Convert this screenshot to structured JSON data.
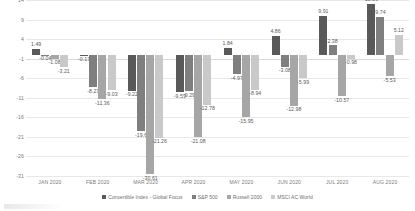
{
  "chart_data": {
    "type": "bar",
    "title": "",
    "subtitle": "",
    "xlabel": "",
    "ylabel": "",
    "ylim": [
      -31,
      14
    ],
    "yticks": [
      14,
      9,
      4,
      -1,
      -6,
      -11,
      -16,
      -21,
      -26,
      -31
    ],
    "grid": true,
    "legend_position": "bottom",
    "categories": [
      "JAN 2020",
      "FEB 2020",
      "MAR 2020",
      "APR 2020",
      "MAY 2020",
      "JUN 2020",
      "JUL 2020",
      "AUG 2020"
    ],
    "series": [
      {
        "name": "Convertible Index - Global Focus",
        "color": "#595959",
        "values": [
          1.49,
          -0.17,
          -9.22,
          -9.53,
          1.84,
          4.86,
          9.91,
          13.06
        ],
        "labels": [
          "1.49",
          "-0.17",
          "-9.22",
          "-9.53",
          "1.84",
          "4.86",
          "9.91",
          "13.06"
        ]
      },
      {
        "name": "S&P 500",
        "color": "#7f7f7f",
        "values": [
          -0.04,
          -8.27,
          -19.6,
          -9.29,
          -4.97,
          -3.08,
          2.38,
          9.74
        ],
        "labels": [
          "-0.04",
          "-8.27",
          "-19.6",
          "-9.29",
          "-4.97",
          "-3.08",
          "2.38",
          "9.74"
        ]
      },
      {
        "name": "Russell 2000",
        "color": "#a6a6a6",
        "values": [
          -1.08,
          -11.36,
          -30.61,
          -21.08,
          -15.95,
          -12.98,
          -10.57,
          -5.53
        ],
        "labels": [
          "-1.08",
          "-11.36",
          "-30.61",
          "-21.08",
          "-15.95",
          "-12.98",
          "-10.57",
          "-5.53"
        ]
      },
      {
        "name": "MSCI AC World",
        "color": "#c9c9c9",
        "values": [
          -3.21,
          -9.03,
          -21.26,
          -12.78,
          -8.94,
          -5.99,
          -0.98,
          5.12
        ],
        "labels": [
          "-3.21",
          "-9.03",
          "-21.26",
          "-12.78",
          "-8.94",
          "-5.99",
          "-0.98",
          "5.12"
        ]
      }
    ]
  },
  "colors": {
    "gridline": "#e8e8e8",
    "zeroline": "#d9d9d9",
    "axis_text": "#7a7a7a",
    "label_text": "#5a5a5a",
    "background": "#ffffff"
  }
}
